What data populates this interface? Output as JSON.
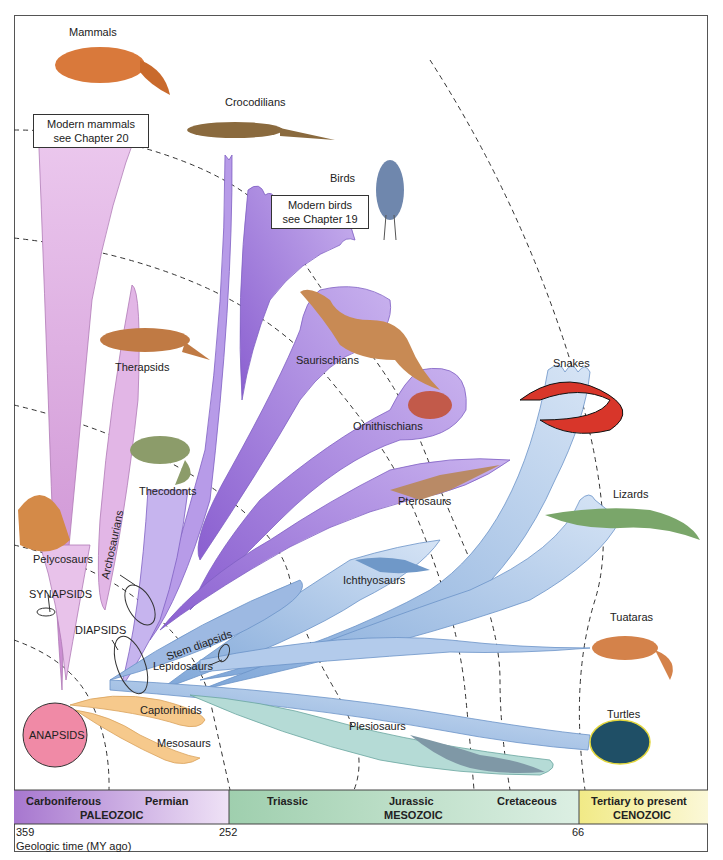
{
  "diagram": {
    "type": "phylogenetic tree of amniotes",
    "colors": {
      "synapsid_branch": "#d9a6dd",
      "archosaur_branch": "#9c74d6",
      "lepidosaur_branch": "#a9c3e6",
      "anapsid_branch": "#f3c27f",
      "plesiosaur_branch": "#a9d3cf",
      "anapsid_circle": "#f08aa6",
      "paleozoic_band": "#b78ad8",
      "mesozoic_band": "#b9dcc0",
      "cenozoic_band": "#f3ef9c"
    },
    "groups": {
      "synapsids": "SYNAPSIDS",
      "diapsids": "DIAPSIDS",
      "anapsids": "ANAPSIDS",
      "archosaurians": "Archosaurians",
      "lepidosaurs": "Lepidosaurs",
      "stem_diapsids": "Stem diapsids"
    },
    "taxa": {
      "mammals": "Mammals",
      "crocodilians": "Crocodilians",
      "birds": "Birds",
      "therapsids": "Therapsids",
      "saurischians": "Saurischians",
      "ornithischians": "Ornithischians",
      "snakes": "Snakes",
      "thecodonts": "Thecodonts",
      "pterosaurs": "Pterosaurs",
      "lizards": "Lizards",
      "pelycosaurs": "Pelycosaurs",
      "ichthyosaurs": "Ichthyosaurs",
      "tuataras": "Tuataras",
      "captorhinids": "Captorhinids",
      "mesosaurs": "Mesosaurs",
      "plesiosaurs": "Plesiosaurs",
      "turtles": "Turtles"
    },
    "callouts": {
      "mammals_line1": "Modern mammals",
      "mammals_line2": "see Chapter 20",
      "birds_line1": "Modern birds",
      "birds_line2": "see Chapter 19"
    },
    "timeline": {
      "eras": [
        {
          "name": "PALEOZOIC",
          "periods": [
            "Carboniferous",
            "Permian"
          ]
        },
        {
          "name": "MESOZOIC",
          "periods": [
            "Triassic",
            "Jurassic",
            "Cretaceous"
          ]
        },
        {
          "name": "CENOZOIC",
          "periods": [
            "Tertiary to present"
          ]
        }
      ],
      "ticks": [
        "359",
        "252",
        "66"
      ],
      "axis_label": "Geologic time (MY ago)"
    }
  }
}
